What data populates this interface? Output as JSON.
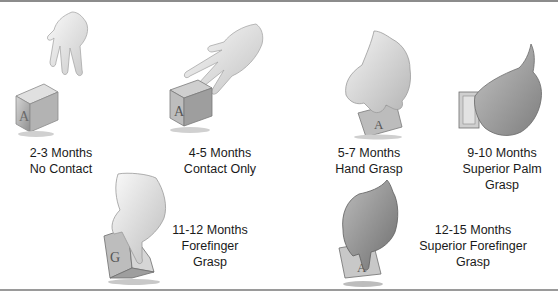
{
  "figure": {
    "stages": [
      {
        "id": "stage-2-3",
        "age": "2-3 Months",
        "lines": [
          "No Contact"
        ]
      },
      {
        "id": "stage-4-5",
        "age": "4-5 Months",
        "lines": [
          "Contact Only"
        ]
      },
      {
        "id": "stage-5-7",
        "age": "5-7 Months",
        "lines": [
          "Hand Grasp"
        ]
      },
      {
        "id": "stage-9-10",
        "age": "9-10 Months",
        "lines": [
          "Superior Palm",
          "Grasp"
        ]
      },
      {
        "id": "stage-11-12",
        "age": "11-12 Months",
        "lines": [
          "Forefinger",
          "Grasp"
        ]
      },
      {
        "id": "stage-12-15",
        "age": "12-15 Months",
        "lines": [
          "Superior Forefinger",
          "Grasp"
        ]
      }
    ],
    "colors": {
      "rule": "#8c8c8c",
      "text": "#1a1a1a",
      "hand_light": "#f1f1f1",
      "hand_dark": "#9a9a9a",
      "block": "#c8c8c8"
    }
  }
}
